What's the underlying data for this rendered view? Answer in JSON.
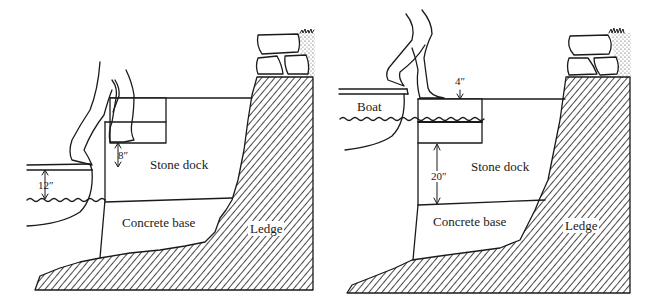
{
  "figure": {
    "panels": [
      {
        "id": "left",
        "labels": {
          "stone_dock": "Stone dock",
          "concrete_base": "Concrete base",
          "ledge": "Ledge",
          "boat_height": "12″",
          "step_height": "8″"
        }
      },
      {
        "id": "right",
        "labels": {
          "boat": "Boat",
          "step_top": "4″",
          "stone_dock": "Stone dock",
          "dock_gap": "20″",
          "concrete_base": "Concrete base",
          "ledge": "Ledge"
        }
      }
    ],
    "colors": {
      "ink": "#1a1a1a",
      "paper": "#ffffff"
    }
  }
}
